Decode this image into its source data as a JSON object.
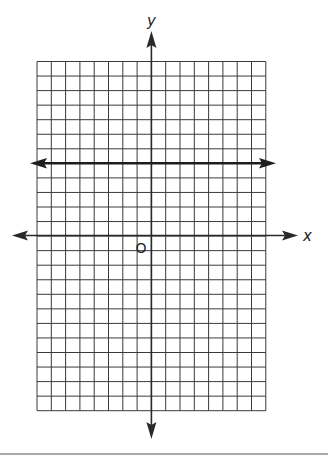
{
  "diagram": {
    "type": "coordinate-grid",
    "grid": {
      "columns": 16,
      "rows": 24,
      "left": 37,
      "top": 61.5,
      "cell_w": 14.3,
      "cell_h": 14.55,
      "line_color": "#3a3a3a"
    },
    "axes": {
      "x_label": "x",
      "y_label": "y",
      "origin_label": "O",
      "y_axis_column": 8,
      "x_axis_row": 12,
      "color": "#2a2a2a"
    },
    "lines": [
      {
        "name": "horizontal-line",
        "row": 7,
        "description": "horizontal line with arrows at both ends, parallel to x-axis"
      }
    ]
  }
}
